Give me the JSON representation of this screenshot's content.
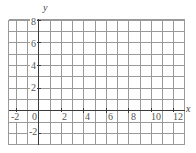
{
  "chart_data": {
    "type": "scatter",
    "title": "",
    "subtitle": "",
    "xlabel": "x",
    "ylabel": "y",
    "xlim": [
      -2.666,
      12.999
    ],
    "ylim": [
      -3.0,
      8.0
    ],
    "grid": true,
    "legend": null,
    "series": [],
    "x": [],
    "values": [],
    "annotations": [],
    "x_ticks": [
      {
        "value": -2,
        "label": "-2"
      },
      {
        "value": 0,
        "label": "0"
      },
      {
        "value": 2,
        "label": "2"
      },
      {
        "value": 4,
        "label": "4"
      },
      {
        "value": 6,
        "label": "6"
      },
      {
        "value": 8,
        "label": "8"
      },
      {
        "value": 10,
        "label": "10"
      },
      {
        "value": 12,
        "label": "12"
      }
    ],
    "y_ticks": [
      {
        "value": 8,
        "label": "8"
      },
      {
        "value": 6,
        "label": "6"
      },
      {
        "value": 4,
        "label": "4"
      },
      {
        "value": 2,
        "label": "2"
      },
      {
        "value": -2,
        "label": "-2"
      }
    ],
    "grid_step_x": 1,
    "grid_step_y": 1,
    "colors": {
      "grid": "#9a9a9a",
      "axis": "#3a3a3a",
      "label": "#555555",
      "background": "#ffffff"
    }
  },
  "labels": {
    "y_axis_name": "y",
    "x_axis_name": "x",
    "origin": "0",
    "x_neg2": "-2",
    "x_2": "2",
    "x_4": "4",
    "x_6": "6",
    "x_8": "8",
    "x_10": "10",
    "x_12": "12",
    "y_8": "8",
    "y_6": "6",
    "y_4": "4",
    "y_2": "2",
    "y_neg2": "-2"
  }
}
